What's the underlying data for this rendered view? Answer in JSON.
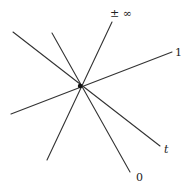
{
  "diagram": {
    "type": "pencil-of-lines",
    "center": {
      "x": 80,
      "y": 86,
      "radius": 2.2
    },
    "stroke_color": "#333333",
    "lines": [
      {
        "id": "line-infinity",
        "label": "± ∞",
        "x1": 47,
        "y1": 160,
        "x2": 112,
        "y2": 22,
        "label_x": 110,
        "label_y": 17,
        "italic": false
      },
      {
        "id": "line-one",
        "label": "1",
        "x1": 11,
        "y1": 114,
        "x2": 172,
        "y2": 52,
        "label_x": 175,
        "label_y": 56,
        "italic": false
      },
      {
        "id": "line-t",
        "label": "t",
        "x1": 13,
        "y1": 32,
        "x2": 160,
        "y2": 146,
        "label_x": 164,
        "label_y": 153,
        "italic": true
      },
      {
        "id": "line-zero",
        "label": "0",
        "x1": 52,
        "y1": 33,
        "x2": 130,
        "y2": 172,
        "label_x": 136,
        "label_y": 181,
        "italic": false
      }
    ]
  }
}
